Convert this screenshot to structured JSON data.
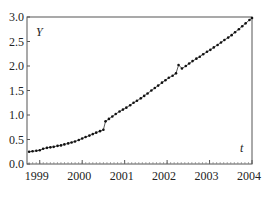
{
  "chart_data": {
    "type": "line",
    "title": "",
    "xlabel": "t",
    "ylabel": "Y",
    "xlim": [
      1998.7,
      2004.0
    ],
    "ylim": [
      0.0,
      3.0
    ],
    "grid": false,
    "legend": null,
    "x_ticks": [
      "1999",
      "2000",
      "2001",
      "2002",
      "2003",
      "2004"
    ],
    "y_ticks": [
      "0.0",
      "0.5",
      "1.0",
      "1.5",
      "2.0",
      "2.5",
      "3.0"
    ],
    "series": [
      {
        "name": "Y",
        "marker": "dot",
        "points": [
          [
            1998.75,
            0.25
          ],
          [
            1998.83,
            0.26
          ],
          [
            1998.92,
            0.27
          ],
          [
            1999.0,
            0.28
          ],
          [
            1999.08,
            0.31
          ],
          [
            1999.17,
            0.33
          ],
          [
            1999.25,
            0.34
          ],
          [
            1999.33,
            0.35
          ],
          [
            1999.42,
            0.37
          ],
          [
            1999.5,
            0.38
          ],
          [
            1999.58,
            0.4
          ],
          [
            1999.67,
            0.42
          ],
          [
            1999.75,
            0.44
          ],
          [
            1999.83,
            0.46
          ],
          [
            1999.92,
            0.49
          ],
          [
            2000.0,
            0.52
          ],
          [
            2000.08,
            0.55
          ],
          [
            2000.17,
            0.58
          ],
          [
            2000.25,
            0.61
          ],
          [
            2000.33,
            0.64
          ],
          [
            2000.42,
            0.67
          ],
          [
            2000.5,
            0.7
          ],
          [
            2000.55,
            0.87
          ],
          [
            2000.63,
            0.92
          ],
          [
            2000.71,
            0.97
          ],
          [
            2000.79,
            1.02
          ],
          [
            2000.88,
            1.07
          ],
          [
            2000.96,
            1.11
          ],
          [
            2001.04,
            1.15
          ],
          [
            2001.13,
            1.2
          ],
          [
            2001.21,
            1.25
          ],
          [
            2001.29,
            1.29
          ],
          [
            2001.38,
            1.34
          ],
          [
            2001.46,
            1.39
          ],
          [
            2001.54,
            1.44
          ],
          [
            2001.63,
            1.5
          ],
          [
            2001.71,
            1.55
          ],
          [
            2001.79,
            1.6
          ],
          [
            2001.88,
            1.66
          ],
          [
            2001.96,
            1.71
          ],
          [
            2002.04,
            1.76
          ],
          [
            2002.13,
            1.8
          ],
          [
            2002.21,
            1.85
          ],
          [
            2002.27,
            2.02
          ],
          [
            2002.35,
            1.95
          ],
          [
            2002.44,
            2.0
          ],
          [
            2002.52,
            2.05
          ],
          [
            2002.6,
            2.1
          ],
          [
            2002.69,
            2.15
          ],
          [
            2002.77,
            2.19
          ],
          [
            2002.85,
            2.24
          ],
          [
            2002.94,
            2.29
          ],
          [
            2003.02,
            2.33
          ],
          [
            2003.1,
            2.38
          ],
          [
            2003.19,
            2.43
          ],
          [
            2003.27,
            2.48
          ],
          [
            2003.35,
            2.53
          ],
          [
            2003.44,
            2.58
          ],
          [
            2003.52,
            2.63
          ],
          [
            2003.6,
            2.69
          ],
          [
            2003.69,
            2.75
          ],
          [
            2003.77,
            2.81
          ],
          [
            2003.85,
            2.87
          ],
          [
            2003.94,
            2.94
          ],
          [
            2004.0,
            2.98
          ]
        ]
      }
    ]
  }
}
